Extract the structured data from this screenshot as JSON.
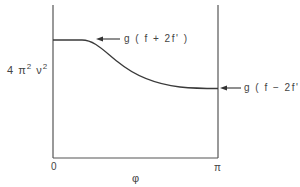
{
  "diagram": {
    "y_label": {
      "base1": "4 π",
      "exp1": "2",
      "base2": " ν",
      "exp2": "2"
    },
    "x_label": "φ",
    "x_ticks": [
      "0",
      "π"
    ],
    "annotations": [
      {
        "id": "upper",
        "text": "g ( f + 2f' )",
        "points_to": "curve plateau at φ = 0"
      },
      {
        "id": "lower",
        "text": "g ( f − 2f' )",
        "points_to": "curve end at φ = π"
      }
    ],
    "curve": {
      "description": "Flat plateau from φ=0, then smooth sigmoid decrease to a lower level at φ=π",
      "start_level": "g(f+2f')",
      "end_level": "g(f−2f')"
    },
    "colors": {
      "line": "#3a3a3a",
      "text": "#444444",
      "background": "#ffffff"
    }
  }
}
